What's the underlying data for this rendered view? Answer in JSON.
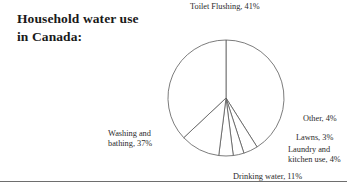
{
  "figure": {
    "title_line1": "Household water use",
    "title_line2": "in Canada:",
    "title_full": "Household water use in Canada:",
    "has_bottom_rule": true,
    "stroke_color": "#5b5b5b",
    "fill_color": "#ffffff",
    "text_color": "#2b2b2b",
    "title_color": "#1a1a1a"
  },
  "labels": {
    "toilet": "Toilet Flushing, 41%",
    "other": "Other, 4%",
    "lawns": "Lawns, 3%",
    "laundry": "Laundry and\nkitchen use, 4%",
    "drinking": "Drinking water, 11%",
    "washing": "Washing and\nbathing, 37%"
  },
  "chart_data": {
    "type": "pie",
    "title": "Household water use in Canada:",
    "xlabel": "",
    "ylabel": "",
    "legend": "none",
    "grid": false,
    "labels_position": "outside",
    "start_angle_deg": 0,
    "direction": "clockwise",
    "center": {
      "x": 226,
      "y": 98
    },
    "radius": 58,
    "categories": [
      "Toilet Flushing",
      "Other",
      "Lawns",
      "Laundry and kitchen use",
      "Drinking water",
      "Washing and bathing"
    ],
    "values": [
      41,
      4,
      3,
      4,
      11,
      37
    ],
    "value_unit": "%",
    "total": 100,
    "slices": [
      {
        "name": "Toilet Flushing",
        "value": 41,
        "label": "Toilet Flushing, 41%",
        "start_deg": 0,
        "end_deg": 147.6
      },
      {
        "name": "Other",
        "value": 4,
        "label": "Other, 4%",
        "start_deg": 147.6,
        "end_deg": 162.0
      },
      {
        "name": "Lawns",
        "value": 3,
        "label": "Lawns, 3%",
        "start_deg": 162.0,
        "end_deg": 172.8
      },
      {
        "name": "Laundry and kitchen use",
        "value": 4,
        "label": "Laundry and kitchen use, 4%",
        "start_deg": 172.8,
        "end_deg": 187.2
      },
      {
        "name": "Drinking water",
        "value": 11,
        "label": "Drinking water, 11%",
        "start_deg": 187.2,
        "end_deg": 226.8
      },
      {
        "name": "Washing and bathing",
        "value": 37,
        "label": "Washing and bathing, 37%",
        "start_deg": 226.8,
        "end_deg": 360.0
      }
    ]
  }
}
